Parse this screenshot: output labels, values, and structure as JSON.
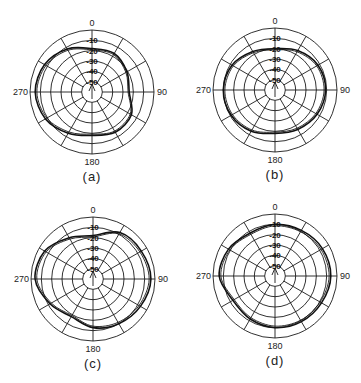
{
  "chart_data": [
    {
      "type": "polar-line",
      "caption": "(a)",
      "center": [
        92,
        92
      ],
      "angle_labels": {
        "top": "0",
        "right": "90",
        "bottom": "180",
        "left": "270"
      },
      "ring_labels": [
        "-10",
        "-20",
        "-30",
        "-40",
        "-50"
      ],
      "rlim_db": [
        -50,
        0
      ],
      "angles_deg": [
        0,
        30,
        60,
        90,
        120,
        150,
        180,
        210,
        240,
        270,
        300,
        330
      ],
      "series": [
        {
          "name": "pattern",
          "values_db": [
            -18,
            -17,
            -21,
            -24,
            -16,
            -15,
            -18,
            -14,
            -8,
            -5,
            -7,
            -12
          ]
        }
      ]
    },
    {
      "type": "polar-line",
      "caption": "(b)",
      "center": [
        275,
        90
      ],
      "angle_labels": {
        "top": "0",
        "right": "90",
        "bottom": "180",
        "left": "270"
      },
      "ring_labels": [
        "-10",
        "-20",
        "-30",
        "-40",
        "-50"
      ],
      "rlim_db": [
        -50,
        0
      ],
      "angles_deg": [
        0,
        30,
        60,
        90,
        120,
        150,
        180,
        210,
        240,
        270,
        300,
        330
      ],
      "series": [
        {
          "name": "pattern",
          "values_db": [
            -20,
            -16,
            -12,
            -11,
            -13,
            -16,
            -18,
            -14,
            -11,
            -10,
            -12,
            -17
          ]
        }
      ]
    },
    {
      "type": "polar-line",
      "caption": "(c)",
      "center": [
        93,
        279
      ],
      "angle_labels": {
        "top": "0",
        "right": "90",
        "bottom": "180",
        "left": "270"
      },
      "ring_labels": [
        "-10",
        "-20",
        "-30",
        "-40",
        "-50"
      ],
      "rlim_db": [
        -50,
        0
      ],
      "angles_deg": [
        0,
        30,
        60,
        90,
        120,
        150,
        180,
        210,
        240,
        270,
        300,
        330
      ],
      "series": [
        {
          "name": "pattern",
          "values_db": [
            -18,
            -8,
            -6,
            -4,
            -7,
            -10,
            -13,
            -18,
            -12,
            -4,
            -6,
            -14
          ]
        }
      ]
    },
    {
      "type": "polar-line",
      "caption": "(d)",
      "center": [
        275,
        276
      ],
      "angle_labels": {
        "top": "0",
        "right": "90",
        "bottom": "180",
        "left": "270"
      },
      "ring_labels": [
        "-10",
        "-20",
        "-30",
        "-40",
        "-50"
      ],
      "rlim_db": [
        -50,
        0
      ],
      "angles_deg": [
        0,
        30,
        60,
        90,
        120,
        150,
        180,
        210,
        240,
        270,
        300,
        330
      ],
      "series": [
        {
          "name": "pattern",
          "values_db": [
            -10,
            -9,
            -7,
            -6,
            -8,
            -9,
            -10,
            -12,
            -13,
            -6,
            -8,
            -12
          ]
        }
      ]
    }
  ]
}
